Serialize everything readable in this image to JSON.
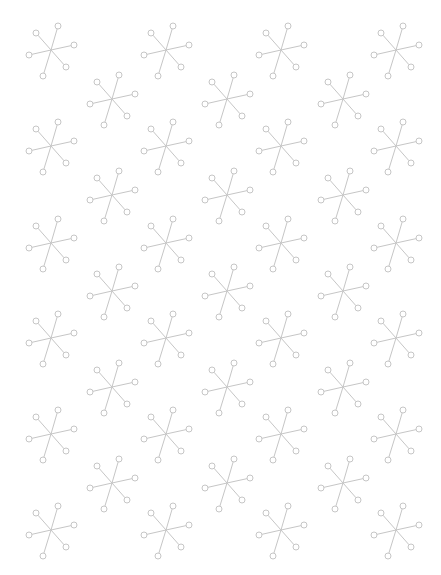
{
  "canvas": {
    "width": 441,
    "height": 575,
    "background": "#ffffff"
  },
  "pattern": {
    "motif": "six-armed-star-with-circle-terminals",
    "stroke_color": "#c6c6c6",
    "stroke_width": 1,
    "node_radius": 3,
    "arms": [
      [
        7,
        -24
      ],
      [
        23,
        -5
      ],
      [
        15,
        17
      ],
      [
        -8,
        26
      ],
      [
        -22,
        5
      ],
      [
        -15,
        -17
      ]
    ],
    "full_row_x": [
      51,
      166,
      281,
      396
    ],
    "offset_row_x": [
      112,
      227,
      343
    ],
    "full_row_y": [
      50,
      146,
      243,
      338,
      434,
      530
    ],
    "offset_row_y": [
      99,
      195,
      291,
      387,
      483
    ]
  }
}
